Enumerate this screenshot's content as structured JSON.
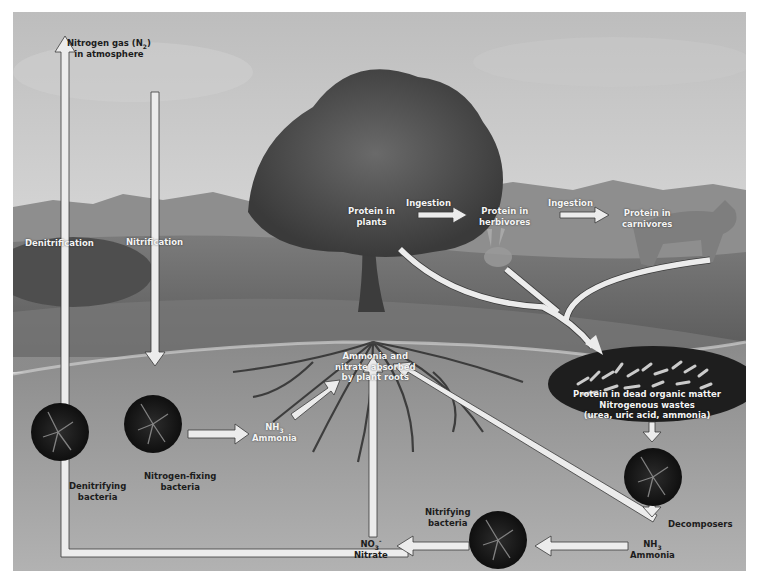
{
  "diagram": {
    "colors": {
      "sky_top": "#c9c9c9",
      "sky_bottom": "#e6e6e6",
      "hills": "#7a7a7a",
      "meadow": "#6d6d6d",
      "soil": "#a3a3a3",
      "arrow_fill": "#ececec",
      "arrow_stroke": "#3a3a3a",
      "bacteria_circle": "#1a1a1a"
    },
    "atmosphere": {
      "line1": "Nitrogen gas (N",
      "sub": "2",
      "line1_end": ")",
      "line2": "in atmosphere"
    },
    "processes": {
      "denitrification": "Denitrification",
      "nitrification": "Nitrification",
      "ingestion_1": "Ingestion",
      "ingestion_2": "Ingestion",
      "decomposers": "Decomposers"
    },
    "nodes": {
      "protein_plants": [
        "Protein in",
        "plants"
      ],
      "protein_herbivores": [
        "Protein in",
        "herbivores"
      ],
      "protein_carnivores": [
        "Protein in",
        "carnivores"
      ],
      "roots_absorb": [
        "Ammonia and",
        "nitrate absorbed",
        "by plant roots"
      ],
      "dead_matter": [
        "Protein in dead organic matter",
        "Nitrogenous wastes",
        "(urea, uric acid, ammonia)"
      ],
      "ammonia_left": {
        "formula": "NH",
        "sub": "3",
        "name": "Ammonia"
      },
      "ammonia_right": {
        "formula": "NH",
        "sub": "3",
        "name": "Ammonia"
      },
      "nitrate": {
        "formula": "NO",
        "sub": "3",
        "sup": "-",
        "name": "Nitrate"
      }
    },
    "bacteria": {
      "denitrifying": [
        "Denitrifying",
        "bacteria"
      ],
      "nitrogen_fixing": [
        "Nitrogen-fixing",
        "bacteria"
      ],
      "nitrifying": [
        "Nitrifying",
        "bacteria"
      ]
    }
  }
}
